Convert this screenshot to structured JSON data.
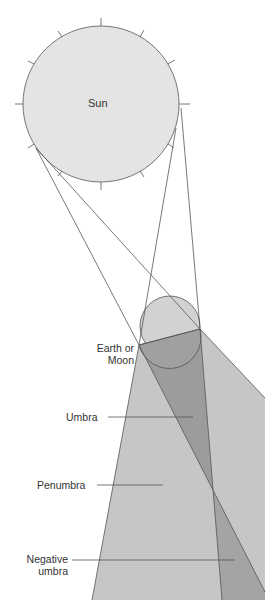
{
  "diagram": {
    "labels": {
      "sun": "Sun",
      "earth_line1": "Earth or",
      "earth_line2": "Moon",
      "umbra": "Umbra",
      "penumbra": "Penumbra",
      "negative_line1": "Negative",
      "negative_line2": "umbra"
    },
    "colors": {
      "sun_fill": "#e2e2e2",
      "penumbra_fill": "#c4c4c4",
      "umbra_fill": "#9a9a9a",
      "earth_fill": "#cfcfcf",
      "line": "#555555"
    }
  }
}
